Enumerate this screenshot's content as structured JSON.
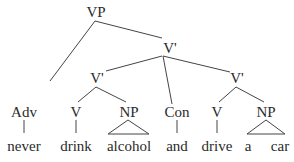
{
  "tree": {
    "root": "VP",
    "nodes": {
      "vp": "VP",
      "vbar_top": "V'",
      "vbar_left": "V'",
      "vbar_right": "V'",
      "adv": "Adv",
      "v1": "V",
      "np1": "NP",
      "con": "Con",
      "v2": "V",
      "np2": "NP"
    },
    "words": {
      "never": "never",
      "drink": "drink",
      "alcohol": "alcohol",
      "and": "and",
      "drive": "drive",
      "a": "a",
      "car": "car"
    },
    "sentence": "never drink alcohol and drive a car"
  }
}
